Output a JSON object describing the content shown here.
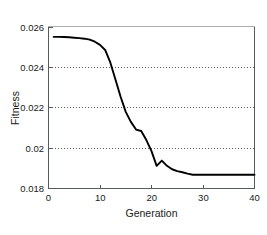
{
  "chart_data": {
    "type": "line",
    "title": "",
    "xlabel": "Generation",
    "ylabel": "Fitness",
    "xlim": [
      0,
      40
    ],
    "ylim": [
      0.018,
      0.026
    ],
    "xticks": [
      "0",
      "10",
      "20",
      "30",
      "40"
    ],
    "xtick_values": [
      0,
      10,
      20,
      30,
      40
    ],
    "yticks": [
      "0.018",
      "0.02",
      "0.022",
      "0.024",
      "0.026"
    ],
    "ytick_values": [
      0.018,
      0.02,
      0.022,
      0.024,
      0.026
    ],
    "grid": "horizontal-dotted",
    "gridlines_y": [
      0.02,
      0.022,
      0.024
    ],
    "legend": "none",
    "series": [
      {
        "name": "Fitness",
        "color": "#000000",
        "x": [
          1,
          2,
          3,
          4,
          5,
          6,
          7,
          8,
          9,
          10,
          11,
          12,
          13,
          14,
          15,
          16,
          17,
          18,
          19,
          20,
          21,
          22,
          23,
          24,
          25,
          26,
          27,
          28,
          29,
          30,
          31,
          32,
          33,
          34,
          35,
          36,
          37,
          38,
          39,
          40
        ],
        "values": [
          0.02552,
          0.02552,
          0.02551,
          0.0255,
          0.02548,
          0.02546,
          0.02543,
          0.02538,
          0.02528,
          0.02512,
          0.02487,
          0.02425,
          0.0234,
          0.02255,
          0.0218,
          0.0213,
          0.02092,
          0.02085,
          0.0204,
          0.01985,
          0.01912,
          0.01938,
          0.01912,
          0.01895,
          0.01886,
          0.0188,
          0.01873,
          0.01868,
          0.01868,
          0.01868,
          0.01868,
          0.01868,
          0.01868,
          0.01868,
          0.01868,
          0.01868,
          0.01868,
          0.01868,
          0.01868,
          0.01868
        ]
      }
    ]
  },
  "axes": {
    "x_title": "Generation",
    "y_title": "Fitness",
    "x_tick_0": "0",
    "x_tick_1": "10",
    "x_tick_2": "20",
    "x_tick_3": "30",
    "x_tick_4": "40",
    "y_tick_0": "0.018",
    "y_tick_1": "0.02",
    "y_tick_2": "0.022",
    "y_tick_3": "0.024",
    "y_tick_4": "0.026"
  },
  "colors": {
    "line": "#000000",
    "frame": "#555a5e",
    "grid": "#4a4a4a",
    "background": "#ffffff",
    "text": "#1a1a1a"
  }
}
